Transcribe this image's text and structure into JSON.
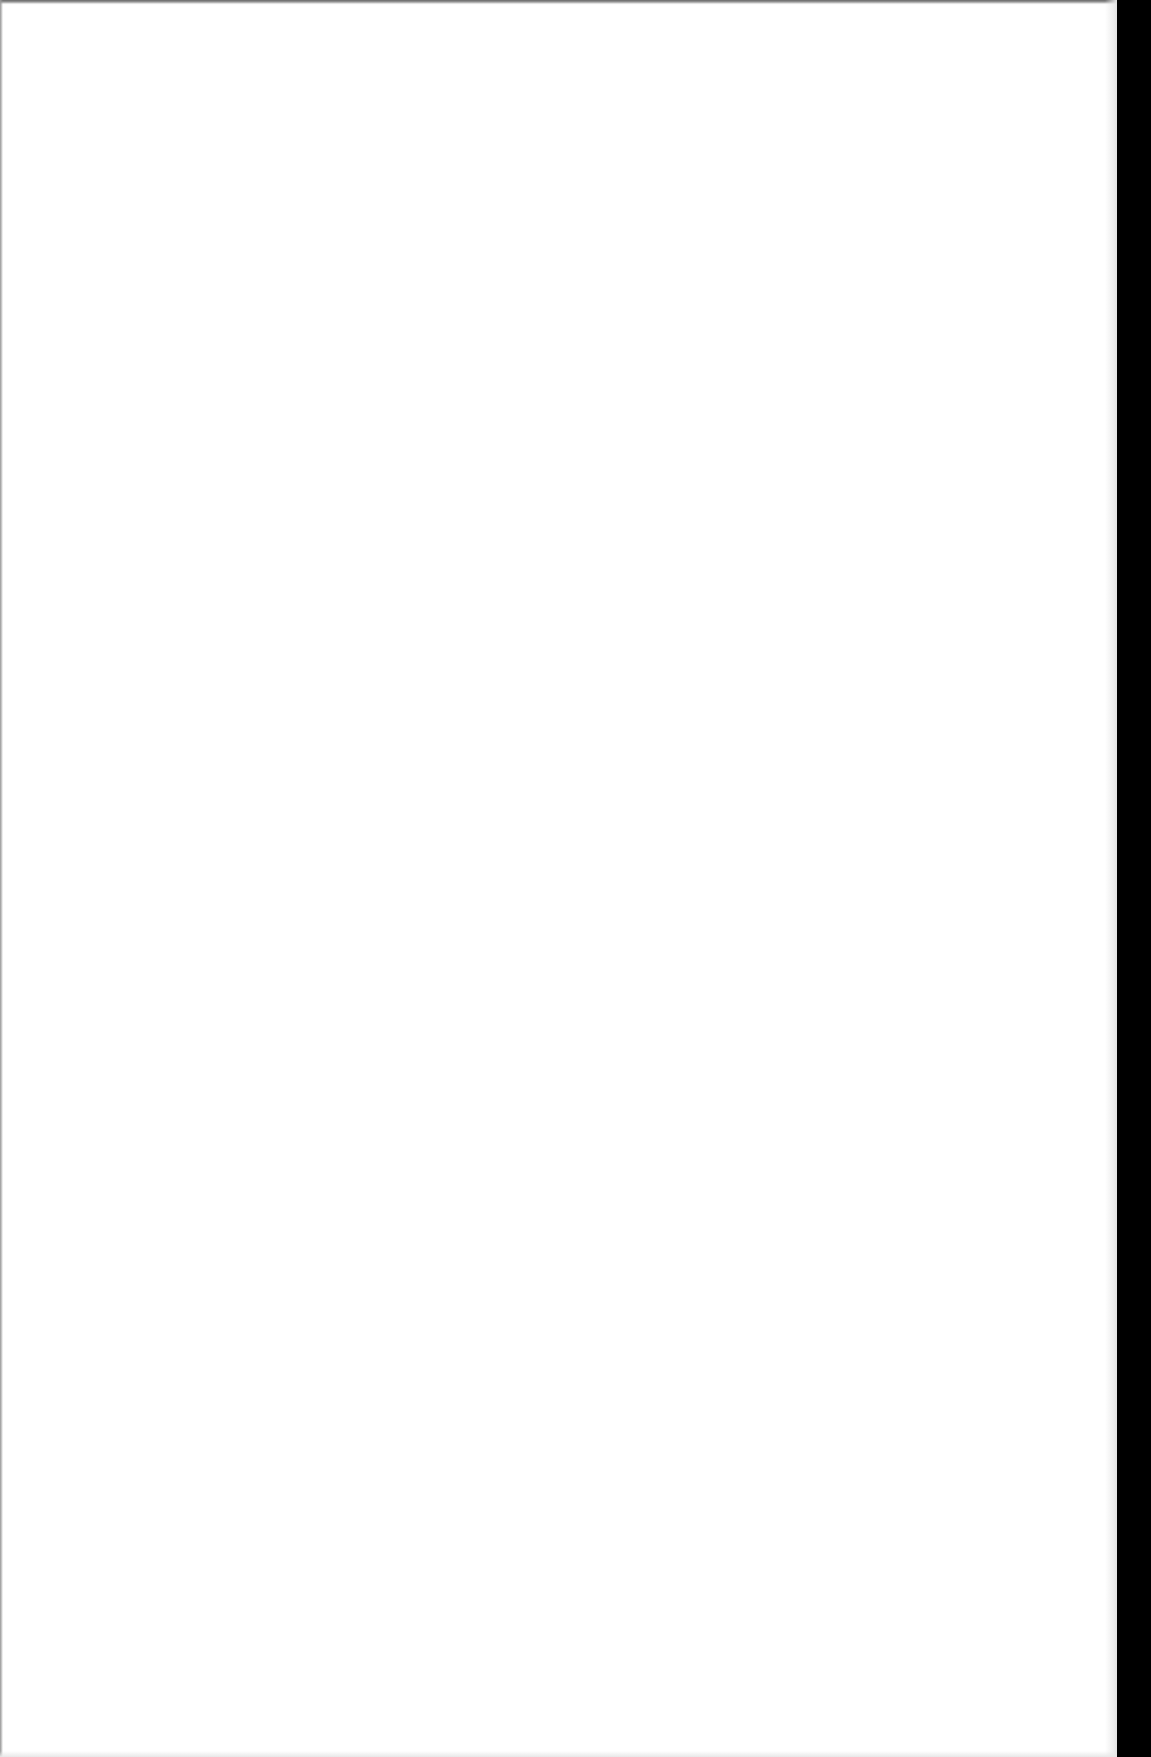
{
  "page": {
    "type": "blank scanned page",
    "content": "",
    "colors": {
      "paper": "#ffffff",
      "scanner_border": "#000000"
    }
  }
}
